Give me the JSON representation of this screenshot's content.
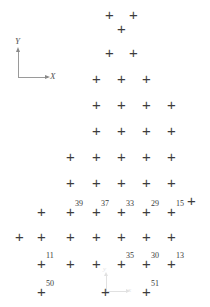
{
  "figure": {
    "background_color": "#ffffff",
    "marker_color": "#3c3c3c",
    "label_color": "#3a3a3a",
    "marker_glyph": "+",
    "width": 210,
    "height": 307
  },
  "axes": {
    "primary": {
      "name": "main-axis-indicator",
      "x_label": "X",
      "y_label": "Y",
      "origin_x": 18,
      "origin_y": 77,
      "color": "#9a9a9a"
    },
    "secondary": {
      "name": "secondary-axis-indicator",
      "x_label": "x",
      "y_label": "y",
      "origin_x": 106,
      "origin_y": 291,
      "color": "#c9c9c9"
    }
  },
  "chart_data": {
    "type": "scatter",
    "xlabel": "X",
    "ylabel": "Y",
    "marker": "+",
    "xlim": [
      0,
      210
    ],
    "ylim": [
      307,
      0
    ],
    "grid": false,
    "legend": null,
    "point_count": 54,
    "labeled_point_count": 11,
    "labels_present": [
      "39",
      "37",
      "33",
      "29",
      "15",
      "11",
      "35",
      "30",
      "13",
      "50",
      "51"
    ],
    "points": [
      {
        "x": 110,
        "y": 14,
        "label": ""
      },
      {
        "x": 134,
        "y": 14,
        "label": ""
      },
      {
        "x": 122,
        "y": 28,
        "label": ""
      },
      {
        "x": 110,
        "y": 52,
        "label": ""
      },
      {
        "x": 134,
        "y": 52,
        "label": ""
      },
      {
        "x": 97,
        "y": 78,
        "label": ""
      },
      {
        "x": 122,
        "y": 78,
        "label": ""
      },
      {
        "x": 147,
        "y": 78,
        "label": ""
      },
      {
        "x": 97,
        "y": 104,
        "label": ""
      },
      {
        "x": 122,
        "y": 104,
        "label": ""
      },
      {
        "x": 147,
        "y": 104,
        "label": ""
      },
      {
        "x": 172,
        "y": 104,
        "label": ""
      },
      {
        "x": 97,
        "y": 130,
        "label": ""
      },
      {
        "x": 122,
        "y": 130,
        "label": ""
      },
      {
        "x": 147,
        "y": 130,
        "label": ""
      },
      {
        "x": 172,
        "y": 130,
        "label": ""
      },
      {
        "x": 71,
        "y": 156,
        "label": ""
      },
      {
        "x": 97,
        "y": 156,
        "label": ""
      },
      {
        "x": 122,
        "y": 156,
        "label": ""
      },
      {
        "x": 147,
        "y": 156,
        "label": ""
      },
      {
        "x": 172,
        "y": 156,
        "label": ""
      },
      {
        "x": 71,
        "y": 182,
        "label": ""
      },
      {
        "x": 97,
        "y": 182,
        "label": ""
      },
      {
        "x": 122,
        "y": 182,
        "label": ""
      },
      {
        "x": 147,
        "y": 182,
        "label": ""
      },
      {
        "x": 172,
        "y": 182,
        "label": ""
      },
      {
        "x": 42,
        "y": 211,
        "label": ""
      },
      {
        "x": 71,
        "y": 211,
        "label": "39"
      },
      {
        "x": 97,
        "y": 211,
        "label": "37"
      },
      {
        "x": 122,
        "y": 211,
        "label": "33"
      },
      {
        "x": 147,
        "y": 211,
        "label": "29"
      },
      {
        "x": 172,
        "y": 211,
        "label": "15"
      },
      {
        "x": 192,
        "y": 200,
        "label": ""
      },
      {
        "x": 20,
        "y": 236,
        "label": ""
      },
      {
        "x": 42,
        "y": 236,
        "label": ""
      },
      {
        "x": 71,
        "y": 236,
        "label": ""
      },
      {
        "x": 97,
        "y": 236,
        "label": ""
      },
      {
        "x": 122,
        "y": 236,
        "label": ""
      },
      {
        "x": 147,
        "y": 236,
        "label": ""
      },
      {
        "x": 172,
        "y": 236,
        "label": ""
      },
      {
        "x": 42,
        "y": 263,
        "label": "11"
      },
      {
        "x": 71,
        "y": 263,
        "label": ""
      },
      {
        "x": 97,
        "y": 263,
        "label": ""
      },
      {
        "x": 122,
        "y": 263,
        "label": "35"
      },
      {
        "x": 147,
        "y": 263,
        "label": "30"
      },
      {
        "x": 172,
        "y": 263,
        "label": "13"
      },
      {
        "x": 42,
        "y": 291,
        "label": "50"
      },
      {
        "x": 106,
        "y": 291,
        "label": ""
      },
      {
        "x": 147,
        "y": 291,
        "label": "51"
      }
    ]
  }
}
